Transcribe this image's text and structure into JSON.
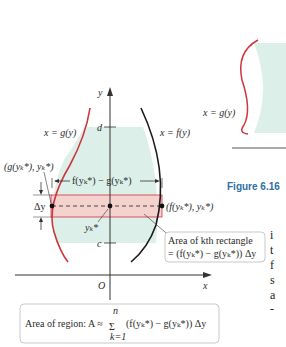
{
  "figure": {
    "caption_label": "Figure 6.16",
    "axes": {
      "x_label": "x",
      "y_label": "y",
      "origin_label": "O"
    },
    "ticks": {
      "top": "d",
      "bottom": "c"
    },
    "curves": {
      "left": {
        "label": "x = g(y)",
        "color": "#d0343c"
      },
      "right": {
        "label": "x = f(y)",
        "color": "#1a1a1a"
      }
    },
    "region_fill": "#dcefe9",
    "strip_fill": "#f4d3cf",
    "strip_border": "#d0343c",
    "labels": {
      "left_point": "(g(yₖ*), yₖ*)",
      "right_point": "(f(yₖ*), yₖ*)",
      "width": "f(yₖ*) − g(yₖ*)",
      "delta_y": "Δy",
      "mid_point": "yₖ*"
    },
    "callout_rectangle": {
      "line1": "Area of kth rectangle",
      "line2": "= (f(yₖ*) − g(yₖ*)) Δy"
    },
    "callout_region": {
      "prefix": "Area of region: A ≈",
      "sum_symbol": "Σ",
      "upper": "n",
      "lower": "k=1",
      "expression": "(f(yₖ*) − g(yₖ*)) Δy"
    }
  },
  "side_figure": {
    "curve_label": "x = g(y)"
  },
  "side_text": [
    "i",
    "t",
    "f",
    "s",
    "a",
    "-"
  ]
}
